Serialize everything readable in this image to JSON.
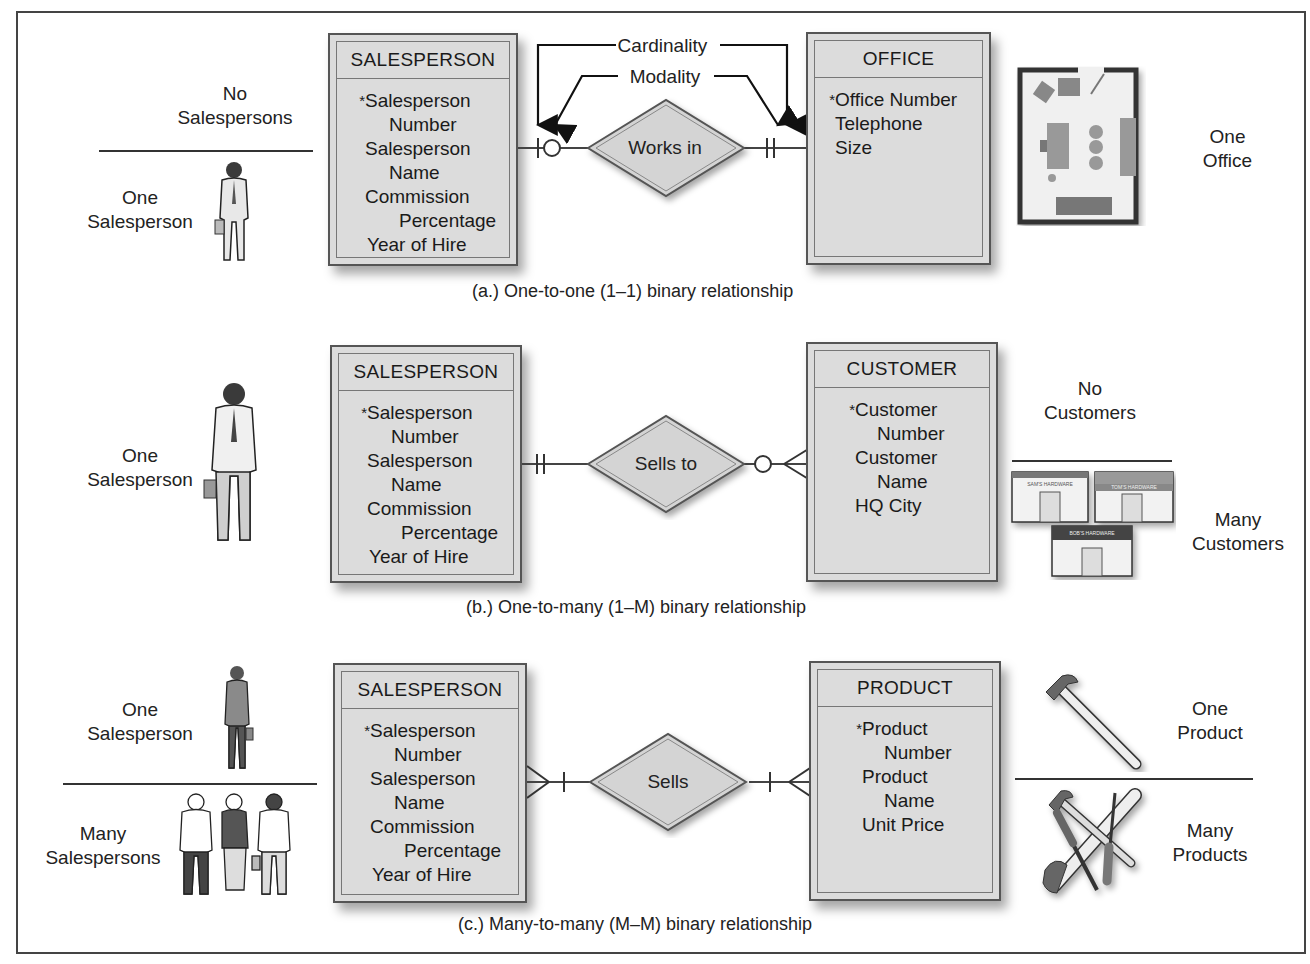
{
  "annotations": {
    "cardinality": "Cardinality",
    "modality": "Modality"
  },
  "sections": [
    {
      "caption": "(a.) One-to-one (1–1) binary relationship",
      "left_entity": {
        "title": "SALESPERSON",
        "attributes": [
          {
            "text": "Salesperson",
            "key": true,
            "indent": 0
          },
          {
            "text": "Number",
            "key": false,
            "indent": 1
          },
          {
            "text": "Salesperson",
            "key": false,
            "indent": 0
          },
          {
            "text": "Name",
            "key": false,
            "indent": 1
          },
          {
            "text": "Commission",
            "key": false,
            "indent": 0
          },
          {
            "text": "Percentage",
            "key": false,
            "indent": 1
          },
          {
            "text": "Year of Hire",
            "key": false,
            "indent": 0
          }
        ]
      },
      "relationship": "Works in",
      "right_entity": {
        "title": "OFFICE",
        "attributes": [
          {
            "text": "Office Number",
            "key": true,
            "indent": 0
          },
          {
            "text": "Telephone",
            "key": false,
            "indent": 0
          },
          {
            "text": "Size",
            "key": false,
            "indent": 0
          }
        ]
      },
      "left_notation": "zero-or-one",
      "right_notation": "exactly-one",
      "left_labels": [
        "No Salespersons",
        "One Salesperson"
      ],
      "right_labels": [
        "One Office"
      ]
    },
    {
      "caption": "(b.) One-to-many (1–M) binary relationship",
      "left_entity": {
        "title": "SALESPERSON",
        "attributes": [
          {
            "text": "Salesperson",
            "key": true,
            "indent": 0
          },
          {
            "text": "Number",
            "key": false,
            "indent": 1
          },
          {
            "text": "Salesperson",
            "key": false,
            "indent": 0
          },
          {
            "text": "Name",
            "key": false,
            "indent": 1
          },
          {
            "text": "Commission",
            "key": false,
            "indent": 0
          },
          {
            "text": "Percentage",
            "key": false,
            "indent": 1
          },
          {
            "text": "Year of Hire",
            "key": false,
            "indent": 0
          }
        ]
      },
      "relationship": "Sells to",
      "right_entity": {
        "title": "CUSTOMER",
        "attributes": [
          {
            "text": "Customer",
            "key": true,
            "indent": 0
          },
          {
            "text": "Number",
            "key": false,
            "indent": 1
          },
          {
            "text": "Customer",
            "key": false,
            "indent": 0
          },
          {
            "text": "Name",
            "key": false,
            "indent": 1
          },
          {
            "text": "HQ City",
            "key": false,
            "indent": 0
          }
        ]
      },
      "left_notation": "exactly-one",
      "right_notation": "zero-or-many",
      "left_labels": [
        "One Salesperson"
      ],
      "right_labels": [
        "No Customers",
        "Many Customers"
      ],
      "store_signs": [
        "SAM'S HARDWARE",
        "TOM'S HARDWARE",
        "BOB'S HARDWARE"
      ]
    },
    {
      "caption": "(c.) Many-to-many (M–M) binary relationship",
      "left_entity": {
        "title": "SALESPERSON",
        "attributes": [
          {
            "text": "Salesperson",
            "key": true,
            "indent": 0
          },
          {
            "text": "Number",
            "key": false,
            "indent": 1
          },
          {
            "text": "Salesperson",
            "key": false,
            "indent": 0
          },
          {
            "text": "Name",
            "key": false,
            "indent": 1
          },
          {
            "text": "Commission",
            "key": false,
            "indent": 0
          },
          {
            "text": "Percentage",
            "key": false,
            "indent": 1
          },
          {
            "text": "Year of Hire",
            "key": false,
            "indent": 0
          }
        ]
      },
      "relationship": "Sells",
      "right_entity": {
        "title": "PRODUCT",
        "attributes": [
          {
            "text": "Product",
            "key": true,
            "indent": 0
          },
          {
            "text": "Number",
            "key": false,
            "indent": 1
          },
          {
            "text": "Product",
            "key": false,
            "indent": 0
          },
          {
            "text": "Name",
            "key": false,
            "indent": 1
          },
          {
            "text": "Unit Price",
            "key": false,
            "indent": 0
          }
        ]
      },
      "left_notation": "one-or-many",
      "right_notation": "one-or-many",
      "left_labels": [
        "One Salesperson",
        "Many Salespersons"
      ],
      "right_labels": [
        "One Product",
        "Many Products"
      ]
    }
  ]
}
